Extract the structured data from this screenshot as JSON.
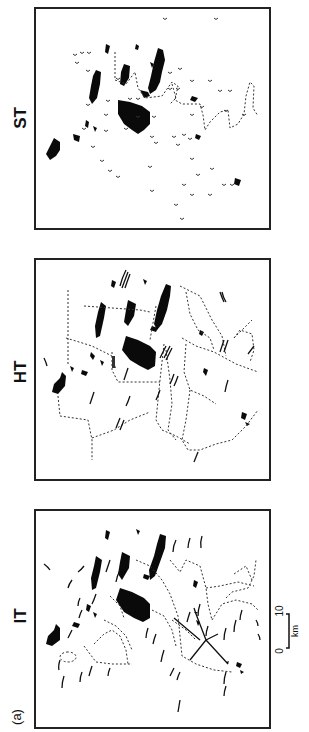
{
  "figure": {
    "panel_letter": "(a)",
    "panels": [
      {
        "id": "st",
        "label": "ST"
      },
      {
        "id": "ht",
        "label": "HT"
      },
      {
        "id": "it",
        "label": "IT"
      }
    ],
    "scale_bar": {
      "start": "0",
      "end": "10",
      "unit": "km"
    }
  }
}
